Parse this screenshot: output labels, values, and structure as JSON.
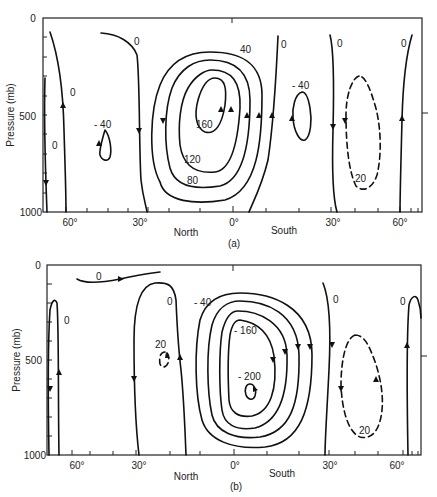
{
  "figure": {
    "y_axis_label": "Pressure (mb)",
    "y_ticks": [
      "0",
      "500",
      "1000"
    ],
    "x_ticks": [
      "60°",
      "30°",
      "0°",
      "30°",
      "60°"
    ],
    "hemisphere_labels": {
      "north": "North",
      "south": "South"
    }
  },
  "panels": [
    {
      "id": "a",
      "caption": "(a)",
      "contour_labels": {
        "left_outer_0": "0",
        "left_inner_0": "0",
        "north_mid_0": "0",
        "north_cell_neg40": "- 40",
        "hadley_40": "40",
        "hadley_80": "80",
        "hadley_120": "120",
        "hadley_160": "160",
        "south_0_a": "0",
        "south_cell_neg40": "- 40",
        "south_0_b": "0",
        "south_dashed_20": "20",
        "south_0_c": "0"
      }
    },
    {
      "id": "b",
      "caption": "(b)",
      "contour_labels": {
        "top_0": "0",
        "left_0": "0",
        "north_0": "0",
        "north_dashed_20": "20",
        "hadley_neg40": "- 40",
        "hadley_neg160": "- 160",
        "hadley_neg200": "- 200",
        "south_0": "0",
        "south_dashed_20": "20",
        "right_0": "0"
      }
    }
  ]
}
